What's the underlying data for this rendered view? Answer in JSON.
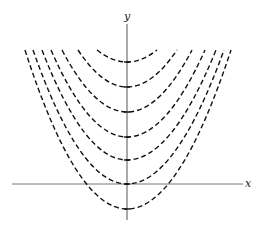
{
  "chart_data": {
    "type": "line",
    "title": "",
    "xlabel": "x",
    "ylabel": "y",
    "grid": false,
    "legend": null,
    "series_style": "dashed",
    "axes_pixels": {
      "origin_x": 127,
      "x_axis_y": 184,
      "x_axis_from": 12,
      "x_axis_to": 243,
      "y_axis_from": 24,
      "y_axis_to": 220
    },
    "curves_pixels": [
      {
        "vertex_y": 62,
        "top_y": 50,
        "left_x": 97,
        "right_x": 157
      },
      {
        "vertex_y": 87,
        "top_y": 50,
        "left_x": 78,
        "right_x": 177
      },
      {
        "vertex_y": 112,
        "top_y": 50,
        "left_x": 62,
        "right_x": 192
      },
      {
        "vertex_y": 137,
        "top_y": 50,
        "left_x": 51,
        "right_x": 205
      },
      {
        "vertex_y": 160,
        "top_y": 50,
        "left_x": 42,
        "right_x": 216
      },
      {
        "vertex_y": 184,
        "top_y": 50,
        "left_x": 33,
        "right_x": 224
      },
      {
        "vertex_y": 209,
        "top_y": 50,
        "left_x": 25,
        "right_x": 231
      }
    ]
  },
  "labels": {
    "x_axis": "x",
    "y_axis": "y"
  }
}
